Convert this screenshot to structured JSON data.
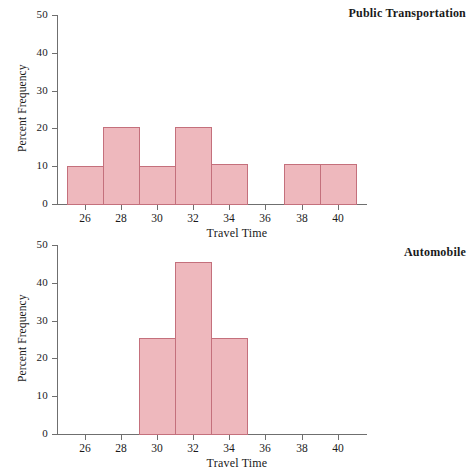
{
  "figure": {
    "background_color": "#ffffff",
    "bar_fill_color": "#eeb8bd",
    "bar_border_color": "#c4707c",
    "axis_color": "#6f6f6f",
    "text_color": "#1a1a1a"
  },
  "panels": [
    {
      "id": "public-transportation",
      "title": "Public Transportation",
      "xlabel": "Travel Time",
      "ylabel": "Percent Frequency"
    },
    {
      "id": "automobile",
      "title": "Automobile",
      "xlabel": "Travel Time",
      "ylabel": "Percent Frequency"
    }
  ],
  "chart_data": [
    {
      "type": "bar",
      "title": "Public Transportation",
      "xlabel": "Travel Time",
      "ylabel": "Percent Frequency",
      "xlim": [
        24.4,
        41.6
      ],
      "ylim": [
        0,
        50
      ],
      "xticks": [
        26,
        28,
        30,
        32,
        34,
        36,
        38,
        40
      ],
      "yticks": [
        0,
        10,
        20,
        30,
        40,
        50
      ],
      "xtick_labels": [
        "26",
        "28",
        "30",
        "32",
        "34",
        "36",
        "38",
        "40"
      ],
      "ytick_labels": [
        "0",
        "10",
        "20",
        "30",
        "40",
        "50"
      ],
      "grid": false,
      "legend": "none",
      "bin_width": 2,
      "bins": [
        {
          "start": 25,
          "end": 27,
          "value": 10.0
        },
        {
          "start": 27,
          "end": 29,
          "value": 20.5
        },
        {
          "start": 29,
          "end": 31,
          "value": 10.0
        },
        {
          "start": 31,
          "end": 33,
          "value": 20.5
        },
        {
          "start": 33,
          "end": 35,
          "value": 10.5
        },
        {
          "start": 35,
          "end": 37,
          "value": 0
        },
        {
          "start": 37,
          "end": 39,
          "value": 10.5
        },
        {
          "start": 39,
          "end": 41,
          "value": 10.5
        }
      ],
      "categories": [
        "25-27",
        "27-29",
        "29-31",
        "31-33",
        "33-35",
        "35-37",
        "37-39",
        "39-41"
      ],
      "values": [
        10.0,
        20.5,
        10.0,
        20.5,
        10.5,
        0,
        10.5,
        10.5
      ]
    },
    {
      "type": "bar",
      "title": "Automobile",
      "xlabel": "Travel Time",
      "ylabel": "Percent Frequency",
      "xlim": [
        24.4,
        41.6
      ],
      "ylim": [
        0,
        50
      ],
      "xticks": [
        26,
        28,
        30,
        32,
        34,
        36,
        38,
        40
      ],
      "yticks": [
        0,
        10,
        20,
        30,
        40,
        50
      ],
      "xtick_labels": [
        "26",
        "28",
        "30",
        "32",
        "34",
        "36",
        "38",
        "40"
      ],
      "ytick_labels": [
        "0",
        "10",
        "20",
        "30",
        "40",
        "50"
      ],
      "grid": false,
      "legend": "none",
      "bin_width": 2,
      "bins": [
        {
          "start": 29,
          "end": 31,
          "value": 25.5
        },
        {
          "start": 31,
          "end": 33,
          "value": 45.5
        },
        {
          "start": 33,
          "end": 35,
          "value": 25.5
        }
      ],
      "categories": [
        "29-31",
        "31-33",
        "33-35"
      ],
      "values": [
        25.5,
        45.5,
        25.5
      ]
    }
  ]
}
